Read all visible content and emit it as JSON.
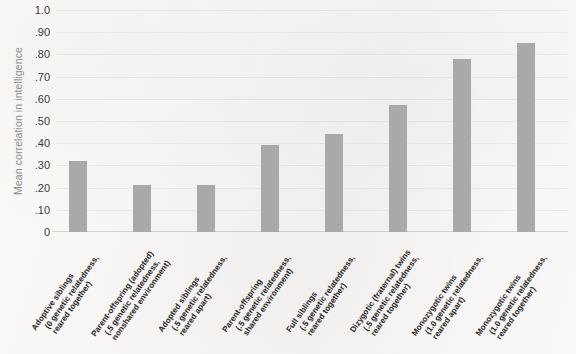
{
  "chart_data": {
    "type": "bar",
    "title": "",
    "xlabel": "",
    "ylabel": "Mean correlation in intelligence",
    "ylim": [
      0,
      1.0
    ],
    "grid": true,
    "legend": "none",
    "ytick_labels": [
      "1.0",
      ".90",
      ".80",
      ".70",
      ".60",
      ".50",
      ".40",
      ".30",
      ".20",
      ".10",
      "0"
    ],
    "ytick_values": [
      1.0,
      0.9,
      0.8,
      0.7,
      0.6,
      0.5,
      0.4,
      0.3,
      0.2,
      0.1,
      0.0
    ],
    "bar_color": "#a9a9a7",
    "background_color": "#f6f5f3",
    "categories": [
      "Adoptive siblings (0 genetic relatedness, reared together)",
      "Parent-offspring (adopted) (.5 genetic relatedness, nonshared environment)",
      "Adopted siblings (.5 genetic relatedness, reared apart)",
      "Parent-offspring (.5 genetic relatedness, shared environment)",
      "Full siblings (.5 genetic relatedness, reared together)",
      "Dizygotic (fraternal) twins (.5 genetic relatedness, reared together)",
      "Monozygotic twins (1.0 genetic relatedness, reared apart)",
      "Monozygotic twins (1.0 genetic relatedness, reared together)"
    ],
    "values": [
      0.32,
      0.21,
      0.21,
      0.39,
      0.44,
      0.57,
      0.78,
      0.85
    ],
    "category_lines": [
      [
        "Adoptive siblings",
        "(0 genetic relatedness,",
        "reared together)"
      ],
      [
        "Parent-offspring (adopted)",
        "(.5 genetic relatedness,",
        "nonshared environment)"
      ],
      [
        "Adopted siblings",
        "(.5 genetic relatedness,",
        "reared apart)"
      ],
      [
        "Parent-offspring",
        "(.5 genetic relatedness,",
        "shared environment)"
      ],
      [
        "Full siblings",
        "(.5 genetic relatedness,",
        "reared together)"
      ],
      [
        "Dizygotic (fraternal) twins",
        "(.5 genetic relatedness,",
        "reared together)"
      ],
      [
        "Monozygotic twins",
        "(1.0 genetic relatedness,",
        "reared apart)"
      ],
      [
        "Monozygotic twins",
        "(1.0 genetic relatedness,",
        "reared together)"
      ]
    ]
  }
}
